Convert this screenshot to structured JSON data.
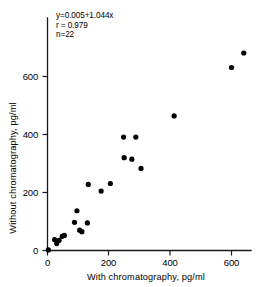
{
  "chart_data": {
    "type": "scatter",
    "title": "",
    "xlabel": "With chromatography, pg/ml",
    "ylabel": "Without chromatography, pg/ml",
    "xlim": [
      0,
      680
    ],
    "ylim": [
      0,
      700
    ],
    "xticks": [
      0,
      200,
      400,
      600
    ],
    "yticks": [
      0,
      200,
      400,
      600
    ],
    "xtick_labels": [
      "0",
      "200",
      "400",
      "600"
    ],
    "ytick_labels": [
      "0",
      "200",
      "400",
      "600"
    ],
    "grid": false,
    "legend": false,
    "annotations": [
      "y=0.005+1.044x",
      "r = 0.979",
      "n=22"
    ],
    "regression": {
      "equation": "y=0.005+1.044x",
      "intercept": 0.005,
      "slope": 1.044,
      "r": 0.979,
      "n": 22
    },
    "series": [
      {
        "name": "samples",
        "marker": "circle",
        "color": "#000000",
        "points": [
          [
            3,
            2
          ],
          [
            23,
            38
          ],
          [
            30,
            24
          ],
          [
            38,
            35
          ],
          [
            48,
            49
          ],
          [
            55,
            52
          ],
          [
            88,
            97
          ],
          [
            96,
            137
          ],
          [
            105,
            70
          ],
          [
            112,
            65
          ],
          [
            130,
            95
          ],
          [
            133,
            228
          ],
          [
            175,
            205
          ],
          [
            205,
            231
          ],
          [
            248,
            391
          ],
          [
            250,
            320
          ],
          [
            275,
            315
          ],
          [
            288,
            391
          ],
          [
            305,
            283
          ],
          [
            413,
            464
          ],
          [
            600,
            631
          ],
          [
            640,
            681
          ]
        ]
      }
    ]
  },
  "axes": {
    "x_axis_name": "x-axis",
    "y_axis_name": "y-axis"
  }
}
